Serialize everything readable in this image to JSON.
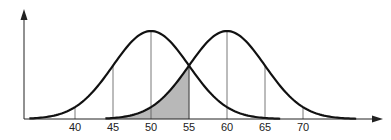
{
  "chart_data": {
    "type": "line",
    "title": "",
    "xlabel": "",
    "ylabel": "",
    "tick_labels": [
      "40",
      "45",
      "50",
      "55",
      "60",
      "65",
      "70"
    ],
    "tick_values": [
      40,
      45,
      50,
      55,
      60,
      65,
      70
    ],
    "xlim": [
      33,
      80
    ],
    "grid": false,
    "legend": null,
    "series": [
      {
        "name": "distribution-mean-50",
        "mean": 50,
        "sd": 5,
        "x_range": [
          34,
          67
        ],
        "guides": [
          40,
          45,
          50,
          55
        ]
      },
      {
        "name": "distribution-mean-60",
        "mean": 60,
        "sd": 5,
        "x_range": [
          44,
          77
        ],
        "guides": [
          55,
          60,
          65,
          70,
          75
        ]
      }
    ],
    "shaded_region": {
      "series": "distribution-mean-60",
      "from": 45,
      "to": 55,
      "color": "#b8b8b8"
    },
    "colors": {
      "curve": "#111111",
      "axis": "#222222",
      "guide": "#555555",
      "shade": "#b8b8b8"
    }
  }
}
